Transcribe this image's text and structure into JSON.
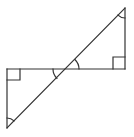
{
  "diagram": {
    "stroke_color": "#333333",
    "background": "#ffffff",
    "points": {
      "top_apex": [
        125,
        8
      ],
      "right_right_angle": [
        125,
        69
      ],
      "intersection": [
        66,
        69
      ],
      "left_right_angle": [
        7,
        69
      ],
      "bottom_apex": [
        7,
        128
      ]
    },
    "angle_marks": [
      {
        "name": "top-apex-angle",
        "type": "arc"
      },
      {
        "name": "right-triangle-vertical-angle",
        "type": "arc"
      },
      {
        "name": "left-triangle-vertical-angle",
        "type": "arc"
      },
      {
        "name": "bottom-apex-angle",
        "type": "arc"
      },
      {
        "name": "right-right-angle",
        "type": "square"
      },
      {
        "name": "left-right-angle",
        "type": "square"
      }
    ]
  }
}
